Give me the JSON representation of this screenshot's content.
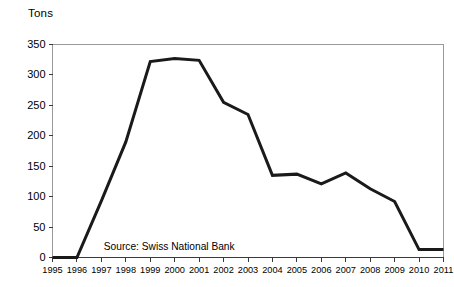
{
  "chart_data": {
    "type": "line",
    "title": "",
    "ylabel": "Tons",
    "xlabel": "",
    "ylim": [
      0,
      350
    ],
    "ytick_step": 50,
    "yticks": [
      "350",
      "300",
      "250",
      "200",
      "150",
      "100",
      "50",
      "0"
    ],
    "ytick_values": [
      350,
      300,
      250,
      200,
      150,
      100,
      50,
      0
    ],
    "grid": false,
    "legend": null,
    "legend_position": "none",
    "categories": [
      "1995",
      "1996",
      "1997",
      "1998",
      "1999",
      "2000",
      "2001",
      "2002",
      "2003",
      "2004",
      "2005",
      "2006",
      "2007",
      "2008",
      "2009",
      "2010",
      "2011"
    ],
    "x": [
      1995,
      1996,
      1997,
      1998,
      1999,
      2000,
      2001,
      2002,
      2003,
      2004,
      2005,
      2006,
      2007,
      2008,
      2009,
      2010,
      2011
    ],
    "values": [
      0,
      0,
      93,
      190,
      322,
      327,
      324,
      255,
      235,
      135,
      137,
      121,
      139,
      113,
      92,
      13,
      13
    ],
    "series": [
      {
        "name": "Tons",
        "color": "#1a1a1a",
        "values": [
          0,
          0,
          93,
          190,
          322,
          327,
          324,
          255,
          235,
          135,
          137,
          121,
          139,
          113,
          92,
          13,
          13
        ]
      }
    ],
    "annotations": [
      {
        "text": "Source: Swiss National Bank",
        "x": 1997.1,
        "y": 18
      }
    ]
  },
  "colors": {
    "line": "#1a1a1a",
    "axis": "#9a9a9a",
    "tick": "#3a3a3a",
    "text": "#000000",
    "background": "#ffffff"
  }
}
